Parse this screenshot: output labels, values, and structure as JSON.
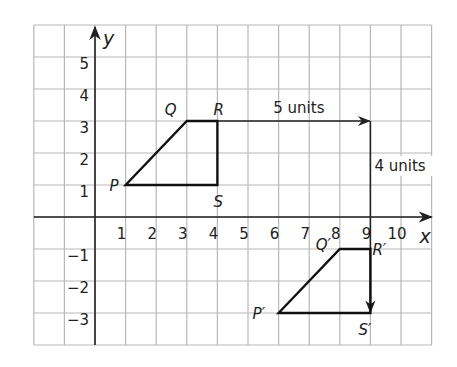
{
  "diagram": {
    "type": "coordinate-grid-translation",
    "grid": {
      "x_min": -2,
      "x_max": 11,
      "y_min": -4,
      "y_max": 6,
      "line_color": "#b8b8b8",
      "border_color": "#b0b0b0"
    },
    "axes": {
      "x_label": "x",
      "y_label": "y",
      "color": "#222222",
      "x_ticks": [
        {
          "v": 1,
          "label": "1"
        },
        {
          "v": 2,
          "label": "2"
        },
        {
          "v": 3,
          "label": "3"
        },
        {
          "v": 4,
          "label": "4"
        },
        {
          "v": 5,
          "label": "5"
        },
        {
          "v": 6,
          "label": "6"
        },
        {
          "v": 7,
          "label": "7"
        },
        {
          "v": 8,
          "label": "8"
        },
        {
          "v": 9,
          "label": "9"
        },
        {
          "v": 10,
          "label": "10"
        }
      ],
      "y_ticks": [
        {
          "v": 5,
          "label": "5"
        },
        {
          "v": 4,
          "label": "4"
        },
        {
          "v": 3,
          "label": "3"
        },
        {
          "v": 2,
          "label": "2"
        },
        {
          "v": 1,
          "label": "1"
        },
        {
          "v": -1,
          "label": "−1"
        },
        {
          "v": -2,
          "label": "−2"
        },
        {
          "v": -3,
          "label": "−3"
        }
      ]
    },
    "original_figure": {
      "name": "PQRS",
      "vertices": [
        {
          "label": "P",
          "x": 1,
          "y": 1
        },
        {
          "label": "Q",
          "x": 3,
          "y": 3
        },
        {
          "label": "R",
          "x": 4,
          "y": 3
        },
        {
          "label": "S",
          "x": 4,
          "y": 1
        }
      ]
    },
    "image_figure": {
      "name": "P′Q′R′S′",
      "vertices": [
        {
          "label": "P′",
          "x": 6,
          "y": -3
        },
        {
          "label": "Q′",
          "x": 8,
          "y": -1
        },
        {
          "label": "R′",
          "x": 9,
          "y": -1
        },
        {
          "label": "S′",
          "x": 9,
          "y": -3
        }
      ]
    },
    "translation": {
      "horizontal": {
        "from": [
          4,
          3
        ],
        "to": [
          9,
          3
        ],
        "label": "5 units"
      },
      "vertical": {
        "from": [
          9,
          3
        ],
        "to": [
          9,
          -3
        ],
        "label": "4 units"
      }
    }
  }
}
